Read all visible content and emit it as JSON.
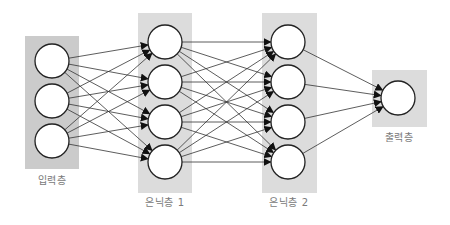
{
  "diagram": {
    "colors": {
      "input_box": "#cbcbcb",
      "hidden_box": "#dcdcdc",
      "output_box": "#dcdcdc",
      "node_fill": "#ffffff",
      "node_stroke": "#222222",
      "edge": "#333333",
      "label": "#7a7a7a"
    },
    "layers": [
      {
        "id": "input",
        "label": "입력층",
        "box": {
          "x": 25,
          "y": 36,
          "w": 54,
          "h": 133
        },
        "label_pos": {
          "x": 52,
          "y": 178
        },
        "nodes": [
          {
            "x": 52,
            "y": 61
          },
          {
            "x": 52,
            "y": 101
          },
          {
            "x": 52,
            "y": 141
          }
        ]
      },
      {
        "id": "hidden1",
        "label": "은닉층 1",
        "box": {
          "x": 138,
          "y": 13,
          "w": 54,
          "h": 180
        },
        "label_pos": {
          "x": 165,
          "y": 200
        },
        "nodes": [
          {
            "x": 165,
            "y": 42
          },
          {
            "x": 165,
            "y": 82
          },
          {
            "x": 165,
            "y": 122
          },
          {
            "x": 165,
            "y": 162
          }
        ]
      },
      {
        "id": "hidden2",
        "label": "은닉층 2",
        "box": {
          "x": 262,
          "y": 13,
          "w": 55,
          "h": 180
        },
        "label_pos": {
          "x": 289,
          "y": 200
        },
        "nodes": [
          {
            "x": 288,
            "y": 42
          },
          {
            "x": 288,
            "y": 82
          },
          {
            "x": 288,
            "y": 122
          },
          {
            "x": 288,
            "y": 162
          }
        ]
      },
      {
        "id": "output",
        "label": "출력층",
        "box": {
          "x": 372,
          "y": 70,
          "w": 55,
          "h": 57
        },
        "label_pos": {
          "x": 399,
          "y": 135
        },
        "nodes": [
          {
            "x": 398,
            "y": 98
          }
        ]
      }
    ],
    "node_radius": 17,
    "connections": "fully-connected between adjacent layers, arrows point right"
  }
}
